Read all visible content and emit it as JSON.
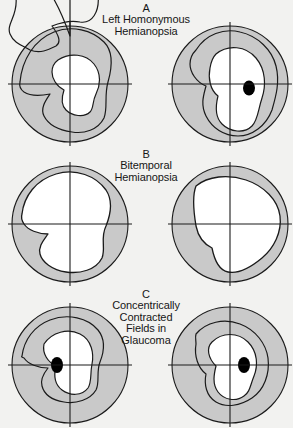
{
  "figure": {
    "background_color": "#f2f2f0",
    "field_fill_color": "#c9c9c9",
    "seeing_area_color": "#ffffff",
    "line_color": "#1a1a1a",
    "blind_spot_color": "#000000"
  },
  "panels": [
    {
      "letter": "A",
      "caption_lines": [
        "Left Homonymous",
        "Hemianopsia"
      ],
      "fields": [
        {
          "eye": "left",
          "isopter_count": 2,
          "blind_spot": false,
          "defect": "left homonymous hemianopsia"
        },
        {
          "eye": "right",
          "isopter_count": 2,
          "blind_spot": true,
          "defect": "left homonymous hemianopsia"
        }
      ]
    },
    {
      "letter": "B",
      "caption_lines": [
        "Bitemporal",
        "Hemianopsia"
      ],
      "fields": [
        {
          "eye": "left",
          "isopter_count": 1,
          "blind_spot": false,
          "defect": "bitemporal hemianopsia"
        },
        {
          "eye": "right",
          "isopter_count": 1,
          "blind_spot": false,
          "defect": "bitemporal hemianopsia"
        }
      ]
    },
    {
      "letter": "C",
      "caption_lines": [
        "Concentrically",
        "Contracted",
        "Fields in",
        "Glaucoma"
      ],
      "fields": [
        {
          "eye": "left",
          "isopter_count": 2,
          "blind_spot": true,
          "defect": "concentric contraction"
        },
        {
          "eye": "right",
          "isopter_count": 2,
          "blind_spot": true,
          "defect": "concentric contraction"
        }
      ]
    }
  ]
}
